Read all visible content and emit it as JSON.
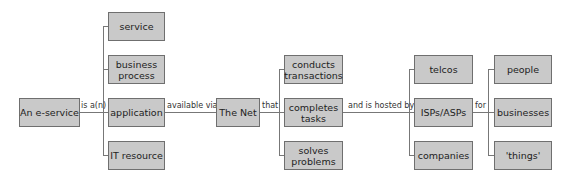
{
  "diagram": {
    "root": "An e-service",
    "edges": {
      "is_a": "is a(n)",
      "available_via": "available via",
      "that": "that",
      "hosted_by": "and is hosted by",
      "for": "for"
    },
    "col1": [
      "service",
      "business process",
      "application",
      "IT resource"
    ],
    "net": "The Net",
    "col3": [
      "conducts transactions",
      "completes tasks",
      "solves problems"
    ],
    "col4": [
      "telcos",
      "ISPs/ASPs",
      "companies"
    ],
    "col5": [
      "people",
      "businesses",
      "'things'"
    ]
  }
}
